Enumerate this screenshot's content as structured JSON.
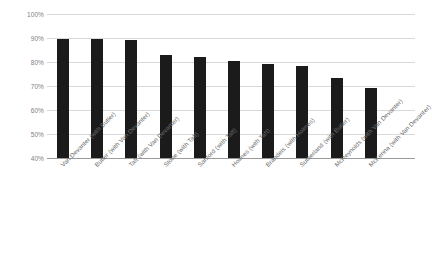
{
  "chart_data": {
    "type": "bar",
    "title": "",
    "xlabel": "",
    "ylabel": "",
    "ylim": [
      40,
      100
    ],
    "ytick_labels": [
      "100%",
      "90%",
      "80%",
      "70%",
      "60%",
      "50%",
      "40%"
    ],
    "ytick_values": [
      100,
      90,
      80,
      70,
      60,
      50,
      40
    ],
    "grid": true,
    "legend": "none",
    "bar_color": "#1b1b1b",
    "gridline_color": "#d9d9d9",
    "axis_color": "#9a9a9a",
    "label_color": "#6b6b6b",
    "categories": [
      "Van Devanter (with Butler)",
      "Butler (with Van Devanter)",
      "Taft (with Van Devanter)",
      "Stone (with Taft)",
      "Sanford (with Taft)",
      "Holmes (with Taft)",
      "Brandeis (with Holmes)",
      "Sutherland (with Butler)",
      "McReynolds (with Van Devanter)",
      "McKenna (with Van Devanter)"
    ],
    "values": [
      89.5,
      89.5,
      89,
      83,
      82,
      80.5,
      79,
      78.5,
      73.5,
      69
    ]
  }
}
